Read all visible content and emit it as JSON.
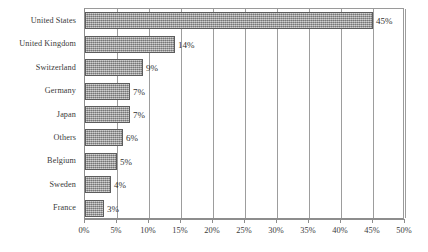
{
  "chart_data": {
    "type": "bar",
    "orientation": "horizontal",
    "title": "",
    "subtitle": "",
    "xlabel": "",
    "ylabel": "",
    "categories": [
      "United States",
      "United Kingdom",
      "Switzerland",
      "Germany",
      "Japan",
      "Others",
      "Belgium",
      "Sweden",
      "France"
    ],
    "values": [
      45,
      14,
      9,
      7,
      7,
      6,
      5,
      4,
      3
    ],
    "value_labels": [
      "45%",
      "14%",
      "9%",
      "7%",
      "7%",
      "6%",
      "5%",
      "4%",
      "3%"
    ],
    "xlim": [
      0,
      50
    ],
    "xticks": [
      0,
      5,
      10,
      15,
      20,
      25,
      30,
      35,
      40,
      45,
      50
    ],
    "xtick_labels": [
      "0%",
      "5%",
      "10%",
      "15%",
      "20%",
      "25%",
      "30%",
      "35%",
      "40%",
      "45%",
      "50%"
    ],
    "grid": "vertical",
    "legend": "none",
    "colors": {
      "bar_fill": "#9d9d9d",
      "bar_border": "#5c5c5c",
      "gridline": "#9d9d9d",
      "axis": "#8d8d8d",
      "text": "#3a3a3a",
      "background": "#ffffff"
    }
  }
}
